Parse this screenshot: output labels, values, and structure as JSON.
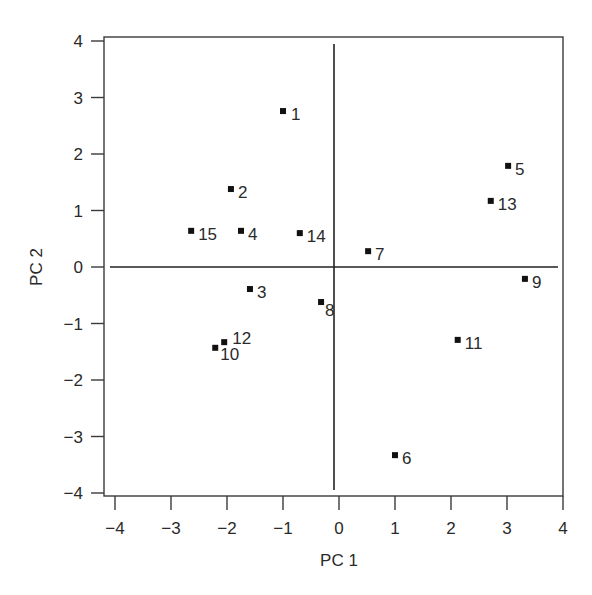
{
  "chart_data": {
    "type": "scatter",
    "title": "",
    "xlabel": "PC 1",
    "ylabel": "PC 2",
    "xlim": [
      -4,
      4
    ],
    "ylim": [
      -4,
      4
    ],
    "xticks": [
      -4,
      -3,
      -2,
      -1,
      0,
      1,
      2,
      3,
      4
    ],
    "yticks": [
      -4,
      -3,
      -2,
      -1,
      0,
      1,
      2,
      3,
      4
    ],
    "xtick_labels": [
      "−4",
      "−3",
      "−2",
      "−1",
      "0",
      "1",
      "2",
      "3",
      "4"
    ],
    "ytick_labels": [
      "−4",
      "−3",
      "−2",
      "−1",
      "0",
      "1",
      "2",
      "3",
      "4"
    ],
    "grid": false,
    "legend": null,
    "reference_lines": {
      "x": 0,
      "y": 0
    },
    "marker": "square",
    "marker_color": "#111111",
    "points": [
      {
        "label": "1",
        "x": -1.0,
        "y": 2.76
      },
      {
        "label": "2",
        "x": -1.93,
        "y": 1.38
      },
      {
        "label": "3",
        "x": -1.59,
        "y": -0.39
      },
      {
        "label": "4",
        "x": -1.75,
        "y": 0.64
      },
      {
        "label": "5",
        "x": 3.02,
        "y": 1.79
      },
      {
        "label": "6",
        "x": 1.0,
        "y": -3.33
      },
      {
        "label": "7",
        "x": 0.52,
        "y": 0.28
      },
      {
        "label": "8",
        "x": -0.32,
        "y": -0.62
      },
      {
        "label": "9",
        "x": 3.32,
        "y": -0.21
      },
      {
        "label": "10",
        "x": -2.21,
        "y": -1.43
      },
      {
        "label": "11",
        "x": 2.12,
        "y": -1.29
      },
      {
        "label": "12",
        "x": -2.05,
        "y": -1.33
      },
      {
        "label": "13",
        "x": 2.71,
        "y": 1.17
      },
      {
        "label": "14",
        "x": -0.7,
        "y": 0.6
      },
      {
        "label": "15",
        "x": -2.64,
        "y": 0.64
      }
    ]
  }
}
